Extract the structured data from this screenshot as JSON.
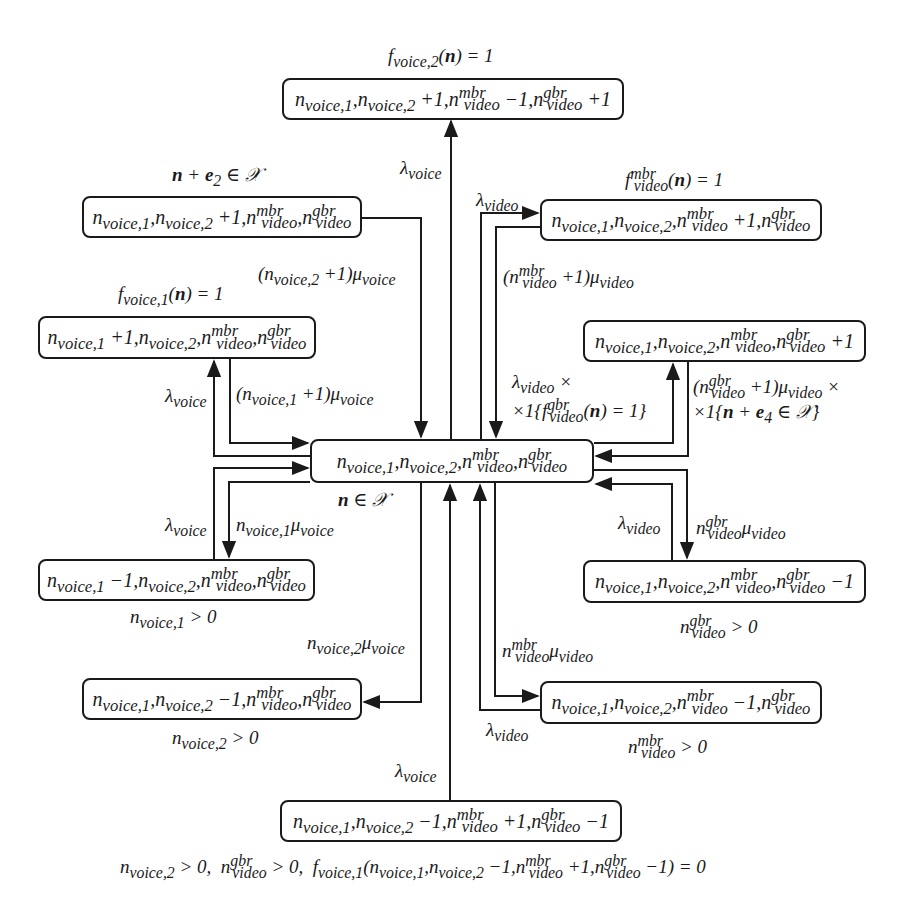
{
  "diagram": {
    "type": "state-transition-diagram",
    "colors": {
      "line": "#1a1a1a",
      "background": "#ffffff"
    },
    "states": {
      "center": {
        "label": "n_voice,1, n_voice,2, n_video^mbr, n_video^gbr",
        "condition": "n ∈ 𝒳"
      },
      "top": {
        "label": "n_voice,1, n_voice,2 +1, n_video^mbr −1, n_video^gbr +1",
        "condition": "f_voice,2 (n) = 1"
      },
      "voice2_plus": {
        "label": "n_voice,1, n_voice,2 +1, n_video^mbr, n_video^gbr",
        "condition": "n + e₂ ∈ 𝒳"
      },
      "mbr_plus": {
        "label": "n_voice,1, n_voice,2, n_video^mbr +1, n_video^gbr",
        "condition": "f_video^mbr (n) = 1"
      },
      "voice1_plus": {
        "label": "n_voice,1 +1, n_voice,2, n_video^mbr, n_video^gbr",
        "condition": "f_voice,1 (n) = 1"
      },
      "gbr_plus": {
        "label": "n_voice,1, n_voice,2, n_video^mbr, n_video^gbr +1",
        "condition": ""
      },
      "voice1_minus": {
        "label": "n_voice,1 −1, n_voice,2, n_video^mbr, n_video^gbr",
        "condition": "n_voice,1 > 0"
      },
      "gbr_minus": {
        "label": "n_voice,1, n_voice,2, n_video^mbr, n_video^gbr −1",
        "condition": "n_video^gbr > 0"
      },
      "voice2_minus": {
        "label": "n_voice,1, n_voice,2 −1, n_video^mbr, n_video^gbr",
        "condition": "n_voice,2 > 0"
      },
      "mbr_minus": {
        "label": "n_voice,1, n_voice,2, n_video^mbr −1, n_video^gbr",
        "condition": "n_video^mbr > 0"
      },
      "bottom": {
        "label": "n_voice,1, n_voice,2 −1, n_video^mbr +1, n_video^gbr −1",
        "condition": "n_voice,2 > 0,  n_video^gbr > 0,  f_voice,1 (n_voice,1, n_voice,2 −1, n_video^mbr +1, n_video^gbr −1) = 0"
      }
    },
    "rates": {
      "center_to_top": "λ_voice",
      "center_to_mbr_plus": "λ_video",
      "mbr_plus_to_center": "(n_video^mbr +1) μ_video",
      "voice2_plus_to_center": "(n_voice,2 +1) μ_voice",
      "center_to_voice1_plus": "λ_voice",
      "voice1_plus_to_center": "(n_voice,1 +1) μ_voice",
      "center_to_gbr_plus": "λ_video × ×1{f_video^gbr (n) = 1}",
      "gbr_plus_to_center": "(n_video^gbr +1) μ_video × ×1{n + e₄ ∈ 𝒳}",
      "voice1_minus_to_center": "λ_voice",
      "center_to_voice1_minus": "n_voice,1 μ_voice",
      "gbr_minus_to_center": "λ_video",
      "center_to_gbr_minus": "n_video^gbr μ_video",
      "center_to_voice2_minus": "n_voice,2 μ_voice",
      "center_to_mbr_minus": "n_video^mbr μ_video",
      "mbr_minus_to_center": "λ_video",
      "bottom_to_center": "λ_voice"
    }
  }
}
